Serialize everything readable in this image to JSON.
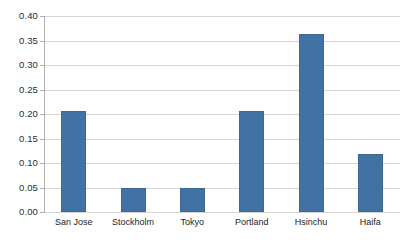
{
  "chart_data": {
    "type": "bar",
    "title": "",
    "subtitle": "",
    "xlabel": "",
    "ylabel": "",
    "categories": [
      "San Jose",
      "Stockholm",
      "Tokyo",
      "Portland",
      "Hsinchu",
      "Haifa"
    ],
    "values": [
      0.207,
      0.048,
      0.048,
      0.207,
      0.363,
      0.118
    ],
    "series": [
      {
        "name": "Series 1",
        "values": [
          0.207,
          0.048,
          0.048,
          0.207,
          0.363,
          0.118
        ]
      }
    ],
    "ylim": [
      0.0,
      0.4
    ],
    "ytick_values": [
      0.0,
      0.05,
      0.1,
      0.15,
      0.2,
      0.25,
      0.3,
      0.35,
      0.4
    ],
    "ytick_labels": [
      "0.00",
      "0.05",
      "0.10",
      "0.15",
      "0.20",
      "0.25",
      "0.30",
      "0.35",
      "0.40"
    ],
    "grid": true,
    "grid_axis": "y",
    "legend": false,
    "legend_position": "none",
    "annotations": []
  },
  "style": {
    "bar_color": "#4172a4",
    "bar_border_color": "#3d678f",
    "gridline_color": "#d6d6d6",
    "axis_color": "#b0b0b0",
    "background_color": "#ffffff",
    "label_color": "#1c1c1c"
  }
}
